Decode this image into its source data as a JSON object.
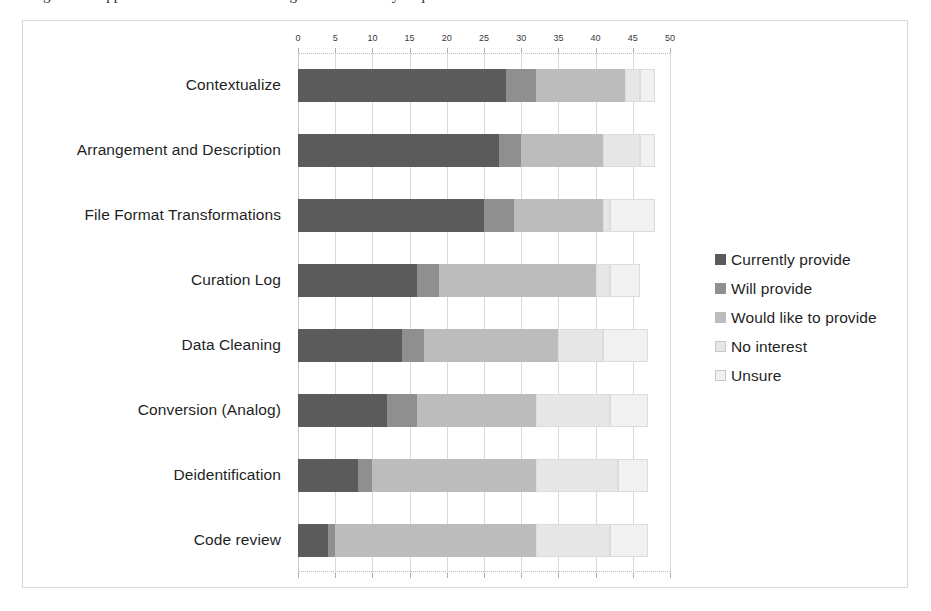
{
  "caption": {
    "text": "Figure 4. Support services offered / willing to be offered by respondents"
  },
  "chart_data": {
    "type": "bar",
    "orientation": "horizontal",
    "stacked": true,
    "title": "",
    "xlabel": "",
    "ylabel": "",
    "xlim": [
      0,
      50
    ],
    "xticks": [
      0,
      5,
      10,
      15,
      20,
      25,
      30,
      35,
      40,
      45,
      50
    ],
    "xtick_labels": [
      "0",
      "5",
      "10",
      "15",
      "20",
      "25",
      "30",
      "35",
      "40",
      "45",
      "50"
    ],
    "grid": true,
    "legend_position": "right",
    "categories": [
      "Contextualize",
      "Arrangement and Description",
      "File Format Transformations",
      "Curation Log",
      "Data Cleaning",
      "Conversion (Analog)",
      "Deidentification",
      "Code review"
    ],
    "series": [
      {
        "name": "Currently provide",
        "color": "#5b5b5b",
        "values": [
          28,
          27,
          25,
          16,
          14,
          12,
          8,
          4
        ]
      },
      {
        "name": "Will provide",
        "color": "#8f8f8f",
        "values": [
          4,
          3,
          4,
          3,
          3,
          4,
          2,
          1
        ]
      },
      {
        "name": "Would like to provide",
        "color": "#bcbcbc",
        "values": [
          12,
          11,
          12,
          21,
          18,
          16,
          22,
          27
        ]
      },
      {
        "name": "No interest",
        "color": "#e6e6e6",
        "values": [
          2,
          5,
          1,
          2,
          6,
          10,
          11,
          10
        ]
      },
      {
        "name": "Unsure",
        "color": "#f1f1f1",
        "values": [
          2,
          2,
          6,
          4,
          6,
          5,
          4,
          5
        ]
      }
    ]
  },
  "legend": {
    "items": [
      {
        "label": "Currently provide",
        "color": "#5b5b5b"
      },
      {
        "label": "Will provide",
        "color": "#8f8f8f"
      },
      {
        "label": "Would like to provide",
        "color": "#bcbcbc"
      },
      {
        "label": "No interest",
        "color": "#e6e6e6"
      },
      {
        "label": "Unsure",
        "color": "#f1f1f1"
      }
    ]
  }
}
